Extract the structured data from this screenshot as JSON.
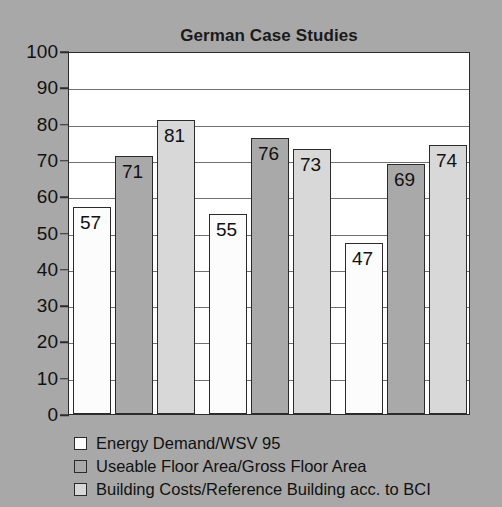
{
  "chart_data": {
    "type": "bar",
    "title": "German Case Studies",
    "xlabel": "",
    "ylabel": "",
    "ylim": [
      0,
      100
    ],
    "ytick_labels": [
      "100",
      "90",
      "80",
      "70",
      "60",
      "50",
      "40",
      "30",
      "20",
      "10",
      "0"
    ],
    "ytick_values": [
      100,
      90,
      80,
      70,
      60,
      50,
      40,
      30,
      20,
      10,
      0
    ],
    "grid": true,
    "legend_position": "below",
    "categories": [
      "Case Study 1",
      "Case Study 2",
      "Case Study 3"
    ],
    "series": [
      {
        "name": "Energy Demand/WSV 95",
        "color": "#fcfcfc",
        "values": [
          57,
          55,
          47
        ]
      },
      {
        "name": "Useable Floor Area/Gross Floor Area",
        "color": "#a9a9a9",
        "values": [
          71,
          76,
          69
        ]
      },
      {
        "name": "Building Costs/Reference Building acc. to BCI",
        "color": "#d8d8d8",
        "values": [
          81,
          73,
          74
        ]
      }
    ]
  },
  "legend": {
    "items": [
      {
        "label": "Energy Demand/WSV 95",
        "color": "#fcfcfc"
      },
      {
        "label": "Useable Floor Area/Gross Floor Area",
        "color": "#a9a9a9"
      },
      {
        "label": "Building Costs/Reference Building acc. to BCI",
        "color": "#d8d8d8"
      }
    ]
  },
  "colors": {
    "background": "#a8a8a8",
    "plot_background": "#ffffff",
    "axis": "#2b2b2b",
    "gridline": "#707070",
    "text": "#111111"
  }
}
